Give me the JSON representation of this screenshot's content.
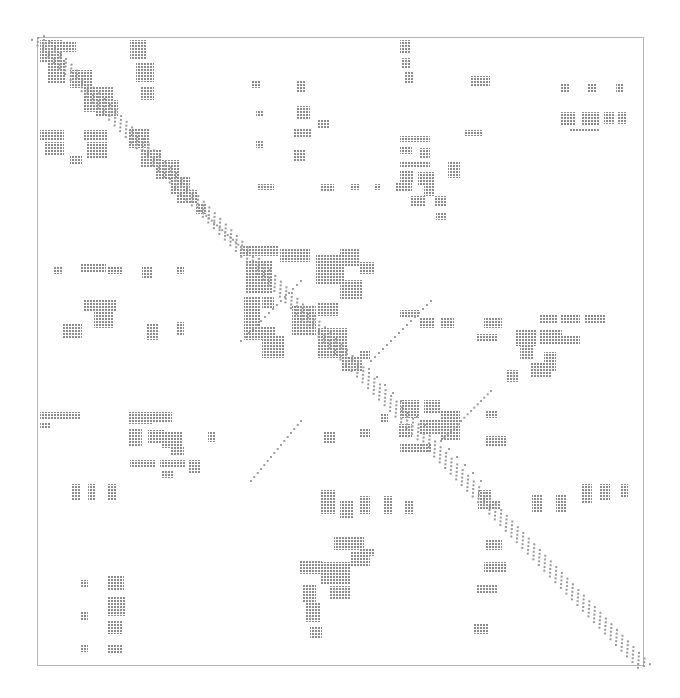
{
  "chart_data": {
    "type": "heatmap",
    "subtype": "sparsity-pattern (spy plot)",
    "title": "",
    "xlabel": "",
    "ylabel": "",
    "grid": false,
    "legend": null,
    "frame": {
      "x": 37,
      "y": 37,
      "w": 606,
      "h": 628
    },
    "dot_color": "#8c8c8c",
    "blocks": [
      [
        40,
        40,
        22,
        22
      ],
      [
        62,
        42,
        14,
        10
      ],
      [
        48,
        60,
        18,
        24
      ],
      [
        70,
        70,
        22,
        18
      ],
      [
        84,
        86,
        30,
        26
      ],
      [
        96,
        100,
        22,
        16
      ],
      [
        130,
        40,
        16,
        20
      ],
      [
        136,
        62,
        18,
        20
      ],
      [
        140,
        86,
        14,
        14
      ],
      [
        40,
        130,
        24,
        10
      ],
      [
        44,
        142,
        20,
        14
      ],
      [
        84,
        130,
        24,
        10
      ],
      [
        86,
        142,
        22,
        16
      ],
      [
        70,
        156,
        12,
        8
      ],
      [
        128,
        128,
        22,
        20
      ],
      [
        140,
        150,
        22,
        18
      ],
      [
        156,
        160,
        24,
        20
      ],
      [
        170,
        176,
        20,
        18
      ],
      [
        176,
        194,
        12,
        10
      ],
      [
        184,
        190,
        14,
        14
      ],
      [
        196,
        204,
        10,
        10
      ],
      [
        252,
        80,
        8,
        8
      ],
      [
        256,
        110,
        8,
        6
      ],
      [
        256,
        140,
        8,
        8
      ],
      [
        296,
        80,
        10,
        12
      ],
      [
        296,
        106,
        14,
        14
      ],
      [
        294,
        128,
        18,
        10
      ],
      [
        294,
        150,
        12,
        12
      ],
      [
        318,
        120,
        12,
        8
      ],
      [
        258,
        184,
        16,
        6
      ],
      [
        320,
        184,
        14,
        8
      ],
      [
        350,
        184,
        10,
        6
      ],
      [
        374,
        184,
        6,
        6
      ],
      [
        400,
        40,
        10,
        14
      ],
      [
        402,
        58,
        8,
        10
      ],
      [
        404,
        72,
        10,
        12
      ],
      [
        470,
        76,
        20,
        10
      ],
      [
        560,
        84,
        10,
        8
      ],
      [
        588,
        84,
        8,
        8
      ],
      [
        616,
        84,
        8,
        8
      ],
      [
        464,
        130,
        18,
        6
      ],
      [
        560,
        112,
        16,
        14
      ],
      [
        582,
        112,
        18,
        14
      ],
      [
        604,
        112,
        10,
        12
      ],
      [
        618,
        112,
        8,
        12
      ],
      [
        570,
        128,
        30,
        4
      ],
      [
        400,
        136,
        30,
        6
      ],
      [
        400,
        146,
        12,
        8
      ],
      [
        420,
        148,
        10,
        10
      ],
      [
        400,
        162,
        30,
        6
      ],
      [
        400,
        170,
        14,
        12
      ],
      [
        418,
        172,
        16,
        14
      ],
      [
        448,
        162,
        12,
        16
      ],
      [
        396,
        182,
        16,
        10
      ],
      [
        424,
        186,
        10,
        10
      ],
      [
        410,
        196,
        16,
        10
      ],
      [
        434,
        196,
        12,
        10
      ],
      [
        436,
        212,
        10,
        8
      ],
      [
        240,
        246,
        38,
        10
      ],
      [
        246,
        260,
        26,
        34
      ],
      [
        280,
        248,
        30,
        14
      ],
      [
        316,
        254,
        28,
        30
      ],
      [
        340,
        248,
        20,
        18
      ],
      [
        360,
        262,
        14,
        12
      ],
      [
        244,
        296,
        16,
        30
      ],
      [
        262,
        296,
        12,
        12
      ],
      [
        292,
        306,
        24,
        30
      ],
      [
        318,
        302,
        20,
        14
      ],
      [
        340,
        280,
        22,
        20
      ],
      [
        244,
        326,
        32,
        14
      ],
      [
        262,
        336,
        22,
        22
      ],
      [
        318,
        328,
        30,
        30
      ],
      [
        342,
        356,
        20,
        16
      ],
      [
        360,
        350,
        10,
        10
      ],
      [
        54,
        266,
        8,
        8
      ],
      [
        80,
        264,
        26,
        8
      ],
      [
        108,
        266,
        14,
        8
      ],
      [
        84,
        300,
        32,
        12
      ],
      [
        94,
        312,
        20,
        16
      ],
      [
        62,
        324,
        20,
        14
      ],
      [
        142,
        266,
        10,
        12
      ],
      [
        176,
        266,
        8,
        8
      ],
      [
        146,
        324,
        12,
        16
      ],
      [
        176,
        322,
        8,
        14
      ],
      [
        400,
        310,
        20,
        8
      ],
      [
        420,
        318,
        14,
        10
      ],
      [
        440,
        318,
        14,
        10
      ],
      [
        484,
        318,
        18,
        10
      ],
      [
        476,
        334,
        22,
        8
      ],
      [
        540,
        314,
        18,
        10
      ],
      [
        560,
        314,
        20,
        10
      ],
      [
        584,
        314,
        22,
        10
      ],
      [
        516,
        330,
        20,
        16
      ],
      [
        540,
        330,
        22,
        14
      ],
      [
        560,
        336,
        20,
        8
      ],
      [
        520,
        346,
        14,
        14
      ],
      [
        530,
        362,
        22,
        16
      ],
      [
        544,
        352,
        12,
        20
      ],
      [
        506,
        370,
        12,
        12
      ],
      [
        400,
        400,
        20,
        18
      ],
      [
        424,
        400,
        16,
        14
      ],
      [
        398,
        424,
        14,
        14
      ],
      [
        420,
        420,
        30,
        14
      ],
      [
        400,
        444,
        32,
        8
      ],
      [
        440,
        410,
        20,
        30
      ],
      [
        486,
        410,
        12,
        8
      ],
      [
        486,
        436,
        20,
        10
      ],
      [
        380,
        414,
        8,
        8
      ],
      [
        40,
        412,
        40,
        8
      ],
      [
        40,
        422,
        10,
        6
      ],
      [
        128,
        412,
        24,
        12
      ],
      [
        152,
        412,
        20,
        10
      ],
      [
        128,
        428,
        14,
        18
      ],
      [
        148,
        430,
        16,
        14
      ],
      [
        162,
        432,
        20,
        16
      ],
      [
        170,
        446,
        14,
        10
      ],
      [
        130,
        460,
        26,
        8
      ],
      [
        160,
        460,
        26,
        8
      ],
      [
        188,
        460,
        12,
        14
      ],
      [
        162,
        470,
        12,
        8
      ],
      [
        208,
        432,
        8,
        10
      ],
      [
        72,
        484,
        8,
        16
      ],
      [
        88,
        484,
        8,
        16
      ],
      [
        108,
        484,
        8,
        16
      ],
      [
        324,
        432,
        12,
        12
      ],
      [
        360,
        428,
        10,
        10
      ],
      [
        320,
        490,
        16,
        24
      ],
      [
        340,
        500,
        14,
        18
      ],
      [
        360,
        496,
        10,
        18
      ],
      [
        384,
        496,
        8,
        18
      ],
      [
        404,
        500,
        10,
        14
      ],
      [
        334,
        536,
        30,
        14
      ],
      [
        350,
        552,
        20,
        14
      ],
      [
        360,
        548,
        14,
        8
      ],
      [
        300,
        560,
        22,
        14
      ],
      [
        320,
        562,
        30,
        22
      ],
      [
        302,
        584,
        14,
        18
      ],
      [
        330,
        586,
        20,
        14
      ],
      [
        306,
        602,
        14,
        20
      ],
      [
        310,
        626,
        12,
        12
      ],
      [
        478,
        490,
        14,
        20
      ],
      [
        490,
        500,
        10,
        10
      ],
      [
        532,
        494,
        10,
        18
      ],
      [
        556,
        494,
        10,
        18
      ],
      [
        582,
        484,
        10,
        20
      ],
      [
        600,
        484,
        10,
        16
      ],
      [
        620,
        484,
        8,
        14
      ],
      [
        486,
        540,
        16,
        10
      ],
      [
        484,
        562,
        22,
        10
      ],
      [
        476,
        584,
        22,
        10
      ],
      [
        474,
        624,
        14,
        10
      ],
      [
        80,
        580,
        8,
        8
      ],
      [
        108,
        576,
        16,
        14
      ],
      [
        108,
        596,
        18,
        20
      ],
      [
        80,
        612,
        8,
        8
      ],
      [
        108,
        620,
        14,
        14
      ],
      [
        80,
        644,
        8,
        8
      ],
      [
        108,
        644,
        14,
        10
      ]
    ],
    "diagonal_band": [
      [
        37,
        37
      ],
      [
        643,
        665
      ]
    ],
    "anti_bands": [
      [
        [
          200,
          210
        ],
        [
          240,
          246
        ]
      ],
      [
        [
          240,
          340
        ],
        [
          300,
          280
        ]
      ],
      [
        [
          360,
          360
        ],
        [
          480,
          480
        ]
      ],
      [
        [
          300,
          420
        ],
        [
          250,
          480
        ]
      ],
      [
        [
          430,
          300
        ],
        [
          370,
          360
        ]
      ],
      [
        [
          490,
          390
        ],
        [
          440,
          440
        ]
      ]
    ]
  }
}
